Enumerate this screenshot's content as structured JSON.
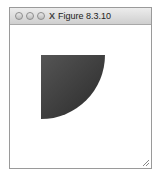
{
  "window": {
    "title": "Figure 8.3.10",
    "app_icon": "X",
    "buttons": [
      "close",
      "minimize",
      "zoom"
    ]
  },
  "figure": {
    "shape": "quarter-disc",
    "fill_gradient": [
      "#2a2a2a",
      "#555555"
    ]
  }
}
